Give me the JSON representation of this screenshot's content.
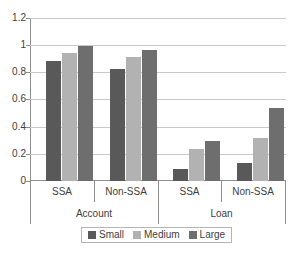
{
  "chart_data": {
    "type": "bar",
    "title": "",
    "subtitle": "",
    "xlabel": "",
    "ylabel": "",
    "ylim": [
      0,
      1.2
    ],
    "ytick_labels": [
      "1.2",
      "1",
      "0.8",
      "0.6",
      "0.4",
      "0.2",
      "0"
    ],
    "ytick_values": [
      1.2,
      1,
      0.8,
      0.6,
      0.4,
      0.2,
      0
    ],
    "grid": true,
    "legend_position": "bottom",
    "group_labels": [
      "Account",
      "Loan"
    ],
    "categories": [
      "SSA",
      "Non-SSA",
      "SSA",
      "Non-SSA"
    ],
    "category_groups": [
      "Account",
      "Account",
      "Loan",
      "Loan"
    ],
    "series": [
      {
        "name": "Small",
        "color": "#595959",
        "values": [
          0.89,
          0.83,
          0.09,
          0.13
        ]
      },
      {
        "name": "Medium",
        "color": "#b2b2b2",
        "values": [
          0.95,
          0.92,
          0.24,
          0.32
        ]
      },
      {
        "name": "Large",
        "color": "#6e6e6e",
        "values": [
          1.0,
          0.97,
          0.3,
          0.54
        ]
      }
    ]
  },
  "axis": {
    "y": {
      "t0": "1.2",
      "t1": "1",
      "t2": "0.8",
      "t3": "0.6",
      "t4": "0.4",
      "t5": "0.2",
      "t6": "0"
    },
    "x": {
      "c0": "SSA",
      "c1": "Non-SSA",
      "c2": "SSA",
      "c3": "Non-SSA",
      "g0": "Account",
      "g1": "Loan"
    }
  },
  "legend": {
    "items": [
      {
        "label": "Small"
      },
      {
        "label": "Medium"
      },
      {
        "label": "Large"
      }
    ]
  }
}
